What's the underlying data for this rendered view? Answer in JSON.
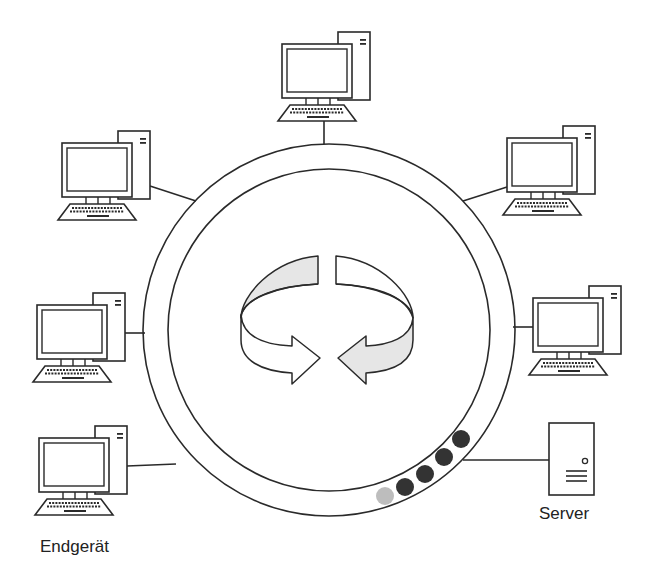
{
  "diagram": {
    "type": "token-ring network",
    "colors": {
      "stroke": "#2a2a2a",
      "arrow_fill": "#e6e6e6",
      "token_dark": "#333333",
      "token_light": "#bdbdbd",
      "background": "#ffffff"
    },
    "ring": {
      "center": [
        329,
        330
      ],
      "outer_radius": 186,
      "inner_radius": 161
    },
    "nodes": [
      {
        "id": "pc-top",
        "kind": "workstation"
      },
      {
        "id": "pc-upper-left",
        "kind": "workstation"
      },
      {
        "id": "pc-upper-right",
        "kind": "workstation"
      },
      {
        "id": "pc-middle-left",
        "kind": "workstation"
      },
      {
        "id": "pc-middle-right",
        "kind": "workstation"
      },
      {
        "id": "pc-lower-left",
        "kind": "workstation"
      },
      {
        "id": "server",
        "kind": "server"
      }
    ],
    "tokens": {
      "dark_count": 4,
      "light_count": 1
    },
    "labels": {
      "endgeraet": "Endgerät",
      "server": "Server"
    }
  }
}
